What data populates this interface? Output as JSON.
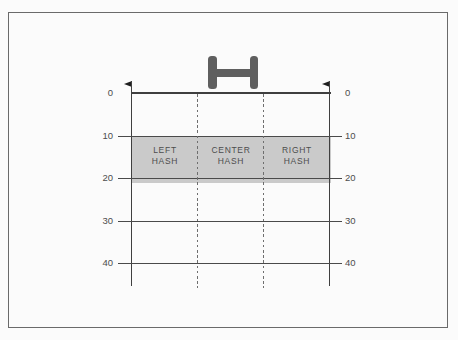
{
  "colors": {
    "page-bg": "#fbfbfb",
    "frame": "#6a6a6a",
    "line": "#3f3f3f",
    "tick-line": "#4a4a4a",
    "dash": "#6e6e6e",
    "band": "#cacaca",
    "goalpost": "#5f5f5f",
    "flag": "#1f1f1f",
    "text": "#4d4d4d"
  },
  "diagram": {
    "name": "football-field-hash-mark-zones",
    "yard_labels": [
      "0",
      "10",
      "20",
      "30",
      "40"
    ],
    "zones": [
      {
        "label": "LEFT\nHASH"
      },
      {
        "label": "CENTER\nHASH"
      },
      {
        "label": "RIGHT\nHASH"
      }
    ],
    "shaded_band": {
      "from_yard": "10",
      "to_yard": "20"
    }
  }
}
